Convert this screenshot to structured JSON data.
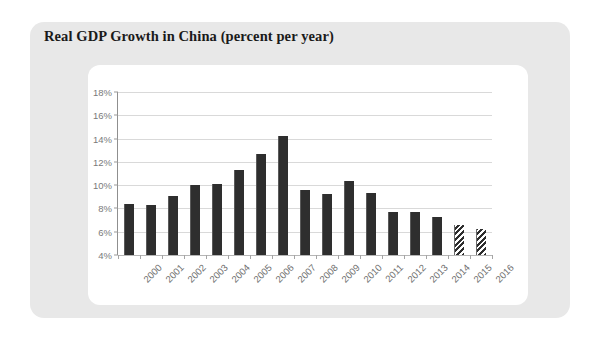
{
  "chart_data": {
    "type": "bar",
    "title": "Real GDP Growth in China (percent per year)",
    "xlabel": "",
    "ylabel": "",
    "ylim": [
      4,
      18
    ],
    "ytick_step": 2,
    "ytick_labels": [
      "4%",
      "6%",
      "8%",
      "10%",
      "12%",
      "14%",
      "16%",
      "18%"
    ],
    "ytick_values": [
      4,
      6,
      8,
      10,
      12,
      14,
      16,
      18
    ],
    "grid": true,
    "legend": "none",
    "categories": [
      "2000",
      "2001",
      "2002",
      "2003",
      "2004",
      "2005",
      "2006",
      "2007",
      "2008",
      "2009",
      "2010",
      "2011",
      "2012",
      "2013",
      "2014",
      "2015",
      "2016"
    ],
    "values": [
      8.4,
      8.3,
      9.1,
      10.0,
      10.1,
      11.3,
      12.7,
      14.2,
      9.6,
      9.2,
      10.4,
      9.3,
      7.7,
      7.7,
      7.3,
      6.6,
      6.2
    ],
    "bar_styles": [
      "solid",
      "solid",
      "solid",
      "solid",
      "solid",
      "solid",
      "solid",
      "solid",
      "solid",
      "solid",
      "solid",
      "solid",
      "solid",
      "solid",
      "solid",
      "hatched",
      "hatched"
    ],
    "series_name": "Real GDP growth",
    "bar_color": "#2e2e2e",
    "grid_color": "#d9d9d9",
    "axis_color": "#8f8f8f",
    "tick_label_color": "#7a7a7a"
  },
  "figure": {
    "panel_color": "#e8e8e8",
    "card_color": "#ffffff",
    "page_color": "#ffffff",
    "title": "Real GDP Growth in China (percent per year)"
  }
}
